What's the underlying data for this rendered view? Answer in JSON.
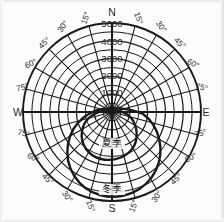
{
  "figure": {
    "kind": "polar-sun-path-diagram",
    "background_color": "#fcfcfc",
    "line_color": "#1a1a1a",
    "text_color": "#2b2b2b",
    "center": {
      "x": 112,
      "y": 112
    },
    "outer_radius": 89
  },
  "cardinals": [
    {
      "key": "north",
      "label": "N",
      "x": 112,
      "y": 16,
      "anchor": "middle"
    },
    {
      "key": "east",
      "label": "E",
      "x": 206,
      "y": 116,
      "anchor": "middle"
    },
    {
      "key": "south",
      "label": "S",
      "x": 112,
      "y": 212,
      "anchor": "middle"
    },
    {
      "key": "west",
      "label": "W",
      "x": 18,
      "y": 116,
      "anchor": "middle"
    }
  ],
  "ring_labels": [
    {
      "value": "5000",
      "y": 27
    },
    {
      "value": "4000",
      "y": 45
    },
    {
      "value": "3000",
      "y": 62
    },
    {
      "value": "2000",
      "y": 79
    },
    {
      "value": "1000",
      "y": 96
    }
  ],
  "ring_values": [
    1000,
    2000,
    3000,
    4000,
    5000
  ],
  "angle_labels": [
    {
      "label": "15°",
      "x": 88,
      "y": 19,
      "rot": -70
    },
    {
      "label": "30°",
      "x": 65,
      "y": 28,
      "rot": -55
    },
    {
      "label": "45°",
      "x": 46,
      "y": 45,
      "rot": -42
    },
    {
      "label": "60°",
      "x": 32,
      "y": 66,
      "rot": -27
    },
    {
      "label": "75°",
      "x": 23,
      "y": 90,
      "rot": -14
    },
    {
      "label": "15°",
      "x": 136,
      "y": 19,
      "rot": 70
    },
    {
      "label": "30°",
      "x": 159,
      "y": 28,
      "rot": 55
    },
    {
      "label": "45°",
      "x": 178,
      "y": 45,
      "rot": 42
    },
    {
      "label": "60°",
      "x": 192,
      "y": 66,
      "rot": 27
    },
    {
      "label": "75°",
      "x": 201,
      "y": 90,
      "rot": 14
    },
    {
      "label": "75°",
      "x": 23,
      "y": 136,
      "rot": 14
    },
    {
      "label": "60°",
      "x": 32,
      "y": 160,
      "rot": 27
    },
    {
      "label": "45°",
      "x": 46,
      "y": 181,
      "rot": 42
    },
    {
      "label": "30°",
      "x": 65,
      "y": 198,
      "rot": 55
    },
    {
      "label": "15°",
      "x": 88,
      "y": 207,
      "rot": 70
    },
    {
      "label": "75°",
      "x": 201,
      "y": 136,
      "rot": -14
    },
    {
      "label": "60°",
      "x": 192,
      "y": 160,
      "rot": -27
    },
    {
      "label": "45°",
      "x": 178,
      "y": 181,
      "rot": -42
    },
    {
      "label": "30°",
      "x": 159,
      "y": 198,
      "rot": -55
    },
    {
      "label": "15°",
      "x": 136,
      "y": 207,
      "rot": -70
    }
  ],
  "curves": [
    {
      "key": "summer",
      "label": "夏季",
      "label_x": 112,
      "label_y": 146,
      "path": "M 112 110 C 96 110 84 118 82 131 C 80 144 88 156 101 159 C 114 162 128 157 134 146 C 139 136 137 122 128 115 C 124 112 118 110 112 110 Z"
    },
    {
      "key": "winter",
      "label": "冬季",
      "label_x": 112,
      "label_y": 192,
      "path": "M 112 108 C 90 108 72 122 68 144 C 64 167 78 189 100 195 C 122 201 146 191 156 170 C 165 151 160 126 143 114 C 134 110 123 108 112 108 Z"
    }
  ],
  "chart_data": {
    "type": "line",
    "title": "",
    "subtitle": "",
    "projection": "polar",
    "xlabel": "",
    "ylabel": "",
    "grid": true,
    "legend_position": "inline-annotation",
    "radial_axis": {
      "tick_labels": [
        "1000",
        "2000",
        "3000",
        "4000",
        "5000"
      ],
      "values": [
        1000,
        2000,
        3000,
        4000,
        5000
      ],
      "rlim": [
        0,
        5000
      ]
    },
    "angular_axis": {
      "cardinal_ticks": [
        "N",
        "E",
        "S",
        "W"
      ],
      "degree_ticks": [
        "15°",
        "30°",
        "45°",
        "60°",
        "75°"
      ],
      "ticks_per_quadrant": 5,
      "tick_step_deg": 15
    },
    "series": [
      {
        "name": "夏季",
        "annotation": "夏季",
        "angles_deg": [
          0,
          30,
          60,
          90,
          120,
          150,
          180,
          210,
          240,
          270,
          300,
          330
        ],
        "values": [
          0,
          300,
          900,
          1350,
          1900,
          2350,
          2550,
          2350,
          1900,
          1350,
          900,
          300
        ]
      },
      {
        "name": "冬季",
        "annotation": "冬季",
        "angles_deg": [
          0,
          30,
          60,
          90,
          120,
          150,
          180,
          210,
          240,
          270,
          300,
          330
        ],
        "values": [
          0,
          600,
          1650,
          2450,
          3450,
          4250,
          4650,
          4250,
          3450,
          2450,
          1650,
          600
        ]
      }
    ]
  }
}
